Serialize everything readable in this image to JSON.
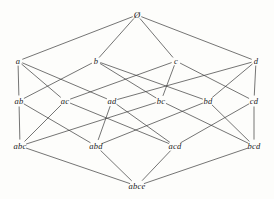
{
  "figure": {
    "kind": "hasse-diagram",
    "title": "",
    "width": 274,
    "height": 199,
    "background_color": "#fdfdfb",
    "line_color": "#3a3a3a",
    "text_color": "#1b1b1b"
  },
  "chart_data": {
    "type": "diagram",
    "title": "",
    "xlabel": "",
    "ylabel": "",
    "levels": [
      {
        "rank": 0,
        "y": 15,
        "labels": [
          "Ø"
        ]
      },
      {
        "rank": 1,
        "y": 61,
        "labels": [
          "a",
          "b",
          "c",
          "d"
        ]
      },
      {
        "rank": 2,
        "y": 101,
        "labels": [
          "ab",
          "ac",
          "ad",
          "bc",
          "bd",
          "cd"
        ]
      },
      {
        "rank": 3,
        "y": 146,
        "labels": [
          "abc",
          "abd",
          "acd",
          "bcd"
        ]
      },
      {
        "rank": 4,
        "y": 186,
        "labels": [
          "abce"
        ]
      }
    ],
    "nodes": [
      {
        "id": "empty",
        "label": "Ø",
        "x": 137,
        "y": 15,
        "rank": 0
      },
      {
        "id": "a",
        "label": "a",
        "x": 18,
        "y": 61,
        "rank": 1
      },
      {
        "id": "b",
        "label": "b",
        "x": 96,
        "y": 61,
        "rank": 1
      },
      {
        "id": "c",
        "label": "c",
        "x": 176,
        "y": 61,
        "rank": 1
      },
      {
        "id": "d",
        "label": "d",
        "x": 256,
        "y": 61,
        "rank": 1
      },
      {
        "id": "ab",
        "label": "ab",
        "x": 19,
        "y": 101,
        "rank": 2
      },
      {
        "id": "ac",
        "label": "ac",
        "x": 65,
        "y": 101,
        "rank": 2
      },
      {
        "id": "ad",
        "label": "ad",
        "x": 112,
        "y": 101,
        "rank": 2
      },
      {
        "id": "bc",
        "label": "bc",
        "x": 161,
        "y": 101,
        "rank": 2
      },
      {
        "id": "bd",
        "label": "bd",
        "x": 208,
        "y": 101,
        "rank": 2
      },
      {
        "id": "cd",
        "label": "cd",
        "x": 254,
        "y": 101,
        "rank": 2
      },
      {
        "id": "abc",
        "label": "abc",
        "x": 20,
        "y": 146,
        "rank": 3
      },
      {
        "id": "abd",
        "label": "abd",
        "x": 96,
        "y": 146,
        "rank": 3
      },
      {
        "id": "acd",
        "label": "acd",
        "x": 175,
        "y": 146,
        "rank": 3
      },
      {
        "id": "bcd",
        "label": "bcd",
        "x": 254,
        "y": 146,
        "rank": 3
      },
      {
        "id": "abce",
        "label": "abce",
        "x": 137,
        "y": 186,
        "rank": 4
      }
    ],
    "edges": [
      {
        "from": "empty",
        "to": "a"
      },
      {
        "from": "empty",
        "to": "b"
      },
      {
        "from": "empty",
        "to": "c"
      },
      {
        "from": "empty",
        "to": "d"
      },
      {
        "from": "a",
        "to": "ab"
      },
      {
        "from": "a",
        "to": "ac"
      },
      {
        "from": "a",
        "to": "ad"
      },
      {
        "from": "b",
        "to": "ab"
      },
      {
        "from": "b",
        "to": "bc"
      },
      {
        "from": "b",
        "to": "bd"
      },
      {
        "from": "c",
        "to": "ac"
      },
      {
        "from": "c",
        "to": "bc"
      },
      {
        "from": "c",
        "to": "cd"
      },
      {
        "from": "d",
        "to": "ad"
      },
      {
        "from": "d",
        "to": "bd"
      },
      {
        "from": "d",
        "to": "cd"
      },
      {
        "from": "ab",
        "to": "abc"
      },
      {
        "from": "ab",
        "to": "abd"
      },
      {
        "from": "ac",
        "to": "abc"
      },
      {
        "from": "ac",
        "to": "acd"
      },
      {
        "from": "ad",
        "to": "abd"
      },
      {
        "from": "ad",
        "to": "acd"
      },
      {
        "from": "bc",
        "to": "abc"
      },
      {
        "from": "bc",
        "to": "bcd"
      },
      {
        "from": "bd",
        "to": "abd"
      },
      {
        "from": "bd",
        "to": "bcd"
      },
      {
        "from": "cd",
        "to": "acd"
      },
      {
        "from": "cd",
        "to": "bcd"
      },
      {
        "from": "abc",
        "to": "abce"
      },
      {
        "from": "abd",
        "to": "abce"
      },
      {
        "from": "acd",
        "to": "abce"
      },
      {
        "from": "bcd",
        "to": "abce"
      }
    ]
  }
}
